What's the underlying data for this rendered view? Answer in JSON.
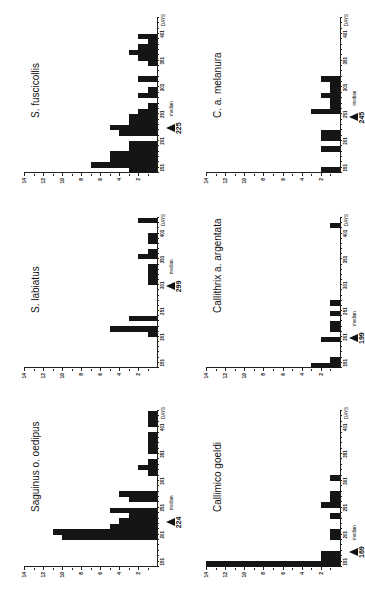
{
  "figure": {
    "orientation": "rotated 90deg counter-clockwise",
    "y_ticks": [
      "2",
      "4",
      "6",
      "8",
      "10",
      "12",
      "14"
    ],
    "x_ticks": [
      "151",
      "201",
      "251",
      "301",
      "351",
      "401"
    ],
    "x_unit_label": "DAYS",
    "median_label": "median"
  },
  "chart_data": [
    {
      "type": "bar",
      "title": "S. fuscicollis",
      "xlabel": "DAYS",
      "ylabel": "",
      "bin_start": 141,
      "bin_width": 10,
      "x": [
        141,
        151,
        161,
        171,
        181,
        191,
        201,
        211,
        221,
        231,
        241,
        251,
        261,
        271,
        281,
        291,
        301,
        311,
        321,
        331,
        341,
        351,
        361,
        371,
        381,
        391,
        401,
        411,
        421
      ],
      "values": [
        3,
        7,
        5,
        5,
        3,
        3,
        0,
        4,
        5,
        3,
        3,
        2,
        1,
        0,
        2,
        1,
        0,
        2,
        0,
        0,
        1,
        2,
        3,
        2,
        1,
        2,
        0,
        0,
        0
      ],
      "median": 225,
      "ylim": [
        0,
        14
      ],
      "xlim": [
        141,
        431
      ]
    },
    {
      "type": "bar",
      "title": "C. a. melanura",
      "xlabel": "DAYS",
      "ylabel": "",
      "x": [
        141,
        151,
        161,
        171,
        181,
        191,
        201,
        211,
        221,
        231,
        241,
        251,
        261,
        271,
        281,
        291,
        301,
        311
      ],
      "values": [
        2,
        0,
        0,
        0,
        2,
        0,
        2,
        2,
        0,
        0,
        0,
        3,
        1,
        1,
        2,
        1,
        1,
        2
      ],
      "median": 245,
      "ylim": [
        0,
        14
      ],
      "xlim": [
        141,
        431
      ]
    },
    {
      "type": "bar",
      "title": "S. labiatus",
      "xlabel": "DAYS",
      "ylabel": "",
      "x": [
        141,
        151,
        161,
        171,
        181,
        191,
        201,
        211,
        221,
        231,
        241,
        251,
        261,
        271,
        281,
        291,
        301,
        311,
        321,
        331,
        341,
        351,
        361,
        371,
        381,
        391,
        401,
        411,
        421
      ],
      "values": [
        0,
        0,
        0,
        0,
        0,
        0,
        1,
        5,
        0,
        3,
        0,
        0,
        0,
        0,
        0,
        0,
        1,
        1,
        1,
        1,
        0,
        2,
        1,
        0,
        1,
        1,
        0,
        0,
        2
      ],
      "median": 299,
      "ylim": [
        0,
        14
      ],
      "xlim": [
        141,
        431
      ]
    },
    {
      "type": "bar",
      "title": "Callithrix a. argentata",
      "xlabel": "DAYS",
      "ylabel": "",
      "x": [
        141,
        151,
        161,
        171,
        181,
        191,
        201,
        211,
        221,
        231,
        241,
        251,
        261,
        271,
        281,
        291,
        301,
        311,
        321,
        331,
        341,
        351,
        361,
        371,
        381,
        391,
        401,
        411
      ],
      "values": [
        3,
        1,
        0,
        0,
        0,
        2,
        0,
        1,
        1,
        0,
        1,
        0,
        1,
        0,
        0,
        0,
        0,
        0,
        0,
        0,
        0,
        0,
        0,
        0,
        0,
        0,
        0,
        1
      ],
      "median": 199,
      "ylim": [
        0,
        14
      ],
      "xlim": [
        141,
        431
      ]
    },
    {
      "type": "bar",
      "title": "Saguinus o. oedipus",
      "xlabel": "DAYS",
      "ylabel": "",
      "x": [
        141,
        151,
        161,
        171,
        181,
        191,
        201,
        211,
        221,
        231,
        241,
        251,
        261,
        271,
        281,
        291,
        301,
        311,
        321,
        331,
        341,
        351,
        361,
        371,
        381,
        391,
        401,
        411,
        421
      ],
      "values": [
        0,
        0,
        0,
        0,
        0,
        10,
        11,
        5,
        4,
        3,
        5,
        0,
        3,
        4,
        0,
        0,
        0,
        1,
        2,
        1,
        0,
        1,
        1,
        1,
        1,
        0,
        1,
        1,
        1
      ],
      "median": 224,
      "ylim": [
        0,
        14
      ],
      "xlim": [
        141,
        431
      ]
    },
    {
      "type": "bar",
      "title": "Callimico goeldi",
      "xlabel": "DAYS",
      "ylabel": "",
      "x": [
        141,
        151,
        161,
        171,
        181,
        191,
        201,
        211,
        221,
        231,
        241,
        251,
        261,
        271,
        281,
        291,
        301
      ],
      "values": [
        14,
        2,
        2,
        0,
        0,
        1,
        1,
        0,
        0,
        1,
        0,
        2,
        1,
        1,
        0,
        0,
        1
      ],
      "median": 169,
      "ylim": [
        0,
        14
      ],
      "xlim": [
        141,
        431
      ]
    }
  ]
}
